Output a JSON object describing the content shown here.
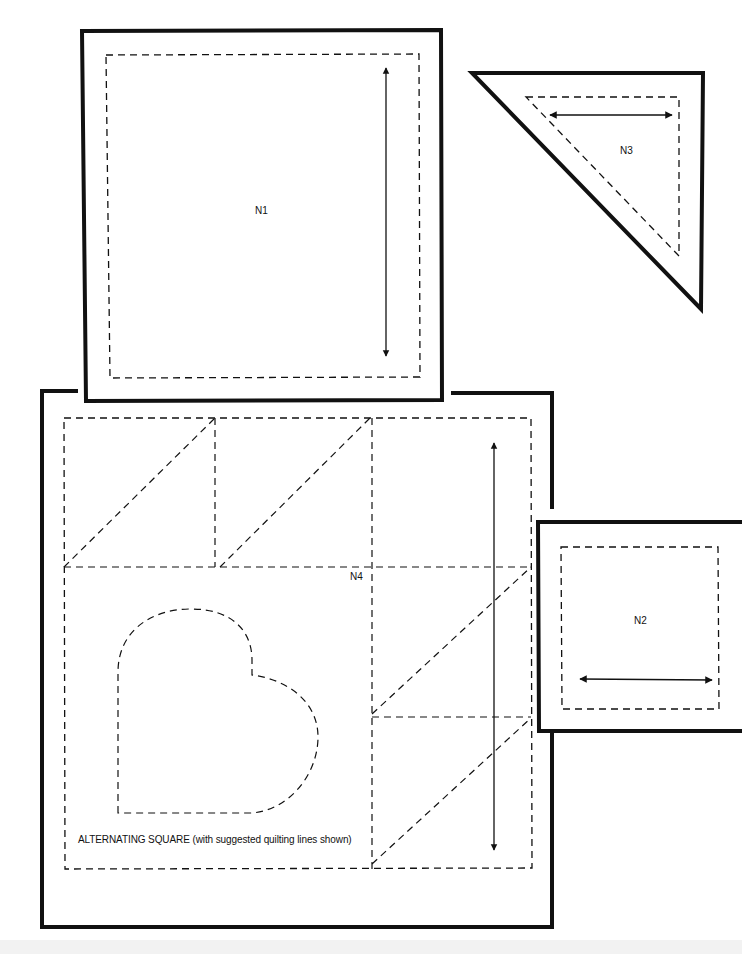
{
  "diagram": {
    "type": "quilt-pattern-templates",
    "background": "#ffffff",
    "line_color": "#111111",
    "pieces": [
      {
        "id": "N1",
        "label": "N1",
        "shape": "square",
        "grainline": "vertical",
        "cut_line": "solid",
        "seam_line": "dashed"
      },
      {
        "id": "N2",
        "label": "N2",
        "shape": "square",
        "grainline": "horizontal",
        "cut_line": "solid",
        "seam_line": "dashed"
      },
      {
        "id": "N3",
        "label": "N3",
        "shape": "right-triangle",
        "grainline": "horizontal",
        "cut_line": "solid",
        "seam_line": "dashed"
      },
      {
        "id": "N4",
        "label": "N4",
        "shape": "square",
        "grainline": "vertical",
        "cut_line": "solid",
        "seam_line": "dashed",
        "caption": "ALTERNATING SQUARE (with suggested quilting lines shown)",
        "quilting_motifs": [
          "heart",
          "diagonal-lines",
          "grid-lines"
        ]
      }
    ]
  }
}
